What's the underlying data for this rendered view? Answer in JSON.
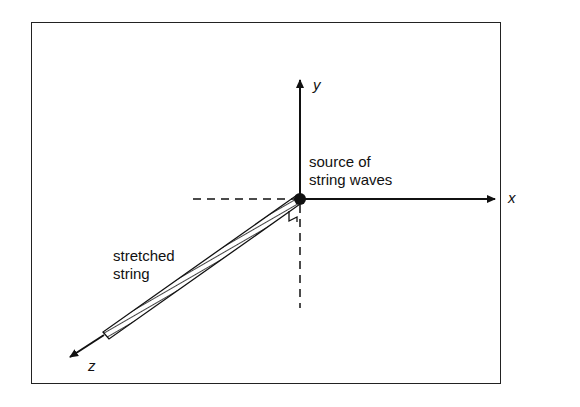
{
  "diagram": {
    "axes": {
      "x_label": "x",
      "y_label": "y",
      "z_label": "z"
    },
    "labels": {
      "source_line1": "source of",
      "source_line2": "string waves",
      "string_line1": "stretched",
      "string_line2": "string"
    },
    "colors": {
      "stroke": "#111111",
      "background": "#ffffff"
    }
  }
}
